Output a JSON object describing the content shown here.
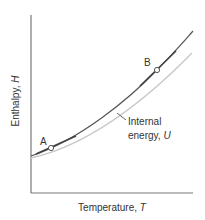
{
  "chart_data": {
    "type": "line",
    "title": "",
    "xlabel": "Temperature, T",
    "ylabel": "Enthalpy, H",
    "xlabel_text": "Temperature, ",
    "xlabel_var": "T",
    "ylabel_text": "Enthalpy, ",
    "ylabel_var": "H",
    "grid": false,
    "ticks": false,
    "series": [
      {
        "name": "Enthalpy, H",
        "color": "#555555",
        "path": "M31,156 C80,140 130,98 157,70 S185,40 193,31"
      },
      {
        "name": "Internal energy, U",
        "color": "#c8c8c8",
        "path": "M31,158 C85,146 140,106 192,53"
      }
    ],
    "points": [
      {
        "label": "A",
        "cx": 51,
        "cy": 148,
        "label_x": 40,
        "label_y": 145
      },
      {
        "label": "B",
        "cx": 157,
        "cy": 70,
        "label_x": 144,
        "label_y": 66
      }
    ],
    "tangents": [
      {
        "at": "A",
        "x1": 36,
        "y1": 154,
        "x2": 76,
        "y2": 136
      },
      {
        "at": "B",
        "x1": 140,
        "y1": 86,
        "x2": 176,
        "y2": 51
      }
    ],
    "annotations": [
      {
        "text_line1": "Internal",
        "text_line2": "energy, ",
        "var": "U",
        "x": 128,
        "y1": 125,
        "y2": 139,
        "leader": {
          "x1": 117,
          "y1": 113,
          "x2": 126,
          "y2": 120
        }
      }
    ],
    "axes": {
      "x0": 31,
      "y0": 193,
      "x_end": 193,
      "y_top": 15
    },
    "colors": {
      "axis": "#777777",
      "text": "#333333",
      "point_fill": "#ffffff",
      "point_stroke": "#555555"
    }
  }
}
